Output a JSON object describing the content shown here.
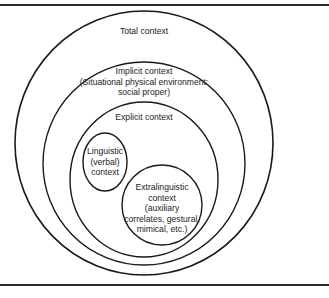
{
  "diagram": {
    "type": "nested-venn",
    "line_color": "#1a1a1a",
    "regions": [
      {
        "id": "total",
        "label": "Total context"
      },
      {
        "id": "implicit",
        "label_lines": [
          "Implicit context",
          "(Situational physical environment:",
          "social proper)"
        ]
      },
      {
        "id": "explicit",
        "label": "Explicit context"
      },
      {
        "id": "linguistic",
        "label_lines": [
          "Linguistic",
          "(verbal)",
          "context"
        ]
      },
      {
        "id": "extralinguistic",
        "label_lines": [
          "Extralinguistic",
          "context",
          "(auxiliary",
          "correlates, gestural,",
          "mimical, etc.)"
        ]
      }
    ],
    "relations": [
      "total contains implicit",
      "implicit contains explicit",
      "explicit contains linguistic",
      "explicit contains extralinguistic",
      "linguistic overlaps extralinguistic"
    ]
  }
}
